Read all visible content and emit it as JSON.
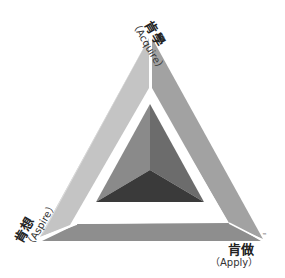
{
  "diagram": {
    "type": "3d-triangle-pyramid",
    "labels": {
      "top": {
        "zh": "肯學",
        "en": "（Acquire）"
      },
      "left": {
        "zh": "肯想",
        "en": "（Aspire）"
      },
      "right": {
        "zh": "肯做",
        "en": "（Apply）"
      }
    },
    "trademark": "™",
    "colors": {
      "frame_left": "#b8b8b8",
      "frame_left_light": "#d0d0d0",
      "frame_right": "#9a9a9a",
      "frame_bottom": "#8c8c8c",
      "pyramid_left": "#8a8a8a",
      "pyramid_right": "#6a6a6a",
      "pyramid_bottom": "#3a3a3a",
      "gap": "#ffffff"
    }
  }
}
